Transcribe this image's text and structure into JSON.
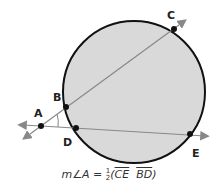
{
  "diagram": {
    "type": "circle-secant-angle",
    "colors": {
      "circle_fill": "#d9d9d9",
      "circle_stroke": "#111111",
      "line": "#888888",
      "point": "#111111"
    },
    "points": {
      "A": {
        "label": "A",
        "x": 41,
        "y": 126
      },
      "B": {
        "label": "B",
        "x": 66,
        "y": 107
      },
      "C": {
        "label": "C",
        "x": 174,
        "y": 29
      },
      "D": {
        "label": "D",
        "x": 76,
        "y": 128
      },
      "E": {
        "label": "E",
        "x": 190,
        "y": 134
      }
    },
    "formula": {
      "lhs": "m∠A =",
      "frac_num": "1",
      "frac_den": "2",
      "arc1": "CE",
      "arc2": "BD",
      "open": "(",
      "close": ")"
    }
  }
}
